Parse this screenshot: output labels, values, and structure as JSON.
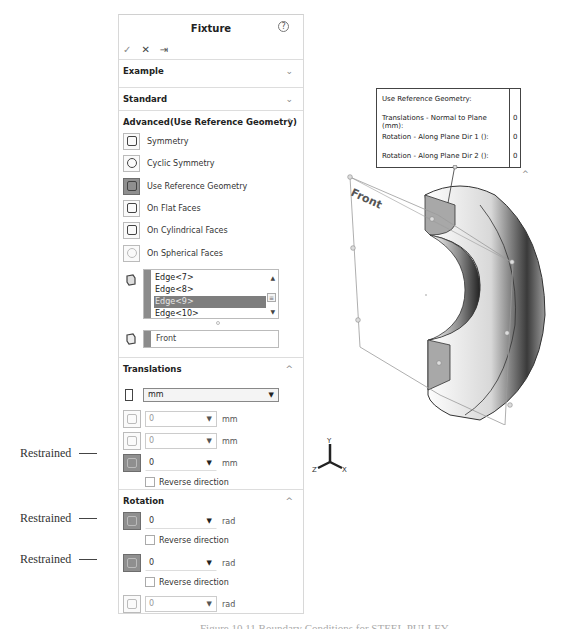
{
  "panel": {
    "title": "Fixture",
    "help_icon": "help-circle-icon",
    "actions": {
      "ok": "✓",
      "cancel": "✕",
      "pin": "⇥"
    },
    "sections": {
      "example": {
        "label": "Example",
        "chevron": "⌄"
      },
      "standard": {
        "label": "Standard",
        "chevron": "⌄"
      },
      "advanced": {
        "label": "Advanced(Use Reference Geometry)",
        "chevron": "^",
        "options": [
          {
            "label": "Symmetry",
            "icon": "symmetry-icon",
            "active": false
          },
          {
            "label": "Cyclic Symmetry",
            "icon": "cyclic-symmetry-icon",
            "active": false
          },
          {
            "label": "Use Reference Geometry",
            "icon": "reference-geometry-icon",
            "active": true
          },
          {
            "label": "On Flat Faces",
            "icon": "flat-faces-icon",
            "active": false
          },
          {
            "label": "On Cylindrical Faces",
            "icon": "cylindrical-faces-icon",
            "active": false
          },
          {
            "label": "On Spherical Faces",
            "icon": "spherical-faces-icon",
            "active": false
          }
        ],
        "entity_list": {
          "items": [
            "Edge<7>",
            "Edge<8>",
            "Edge<9>",
            "Edge<10>"
          ],
          "selected_index": 2
        },
        "reference": "Front"
      },
      "translations": {
        "label": "Translations",
        "chevron": "^",
        "unit": "mm",
        "fields": [
          {
            "value": "0",
            "unit": "mm",
            "enabled": false,
            "restrained": false
          },
          {
            "value": "0",
            "unit": "mm",
            "enabled": false,
            "restrained": false
          },
          {
            "value": "0",
            "unit": "mm",
            "enabled": true,
            "restrained": true
          }
        ],
        "reverse_direction": "Reverse direction"
      },
      "rotation": {
        "label": "Rotation",
        "chevron": "^",
        "fields": [
          {
            "value": "0",
            "unit": "rad",
            "enabled": true,
            "restrained": true
          },
          {
            "value": "0",
            "unit": "rad",
            "enabled": true,
            "restrained": true
          },
          {
            "value": "0",
            "unit": "rad",
            "enabled": false,
            "restrained": false
          }
        ],
        "reverse_direction": "Reverse direction"
      }
    }
  },
  "annotations": [
    "Restrained",
    "Restrained",
    "Restrained"
  ],
  "graphics": {
    "callout": {
      "title": "Use Reference Geometry:",
      "rows": [
        {
          "label": "Translations - Normal to Plane (mm):",
          "value": "0"
        },
        {
          "label": "Rotation - Along Plane Dir 1 ():",
          "value": "0"
        },
        {
          "label": "Rotation - Along Plane Dir 2 ():",
          "value": "0"
        }
      ]
    },
    "plane_label": "Front",
    "triad": {
      "x": "X",
      "y": "Y",
      "z": "Z"
    }
  },
  "caption": "Figure 10.11  Boundary Conditions for STEEL PULLEY"
}
